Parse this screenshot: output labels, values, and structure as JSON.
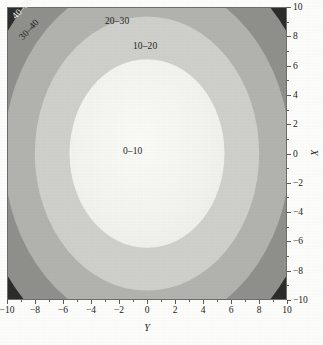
{
  "chart_data": {
    "type": "contour",
    "title": "",
    "xlabel": "Y",
    "ylabel": "X",
    "xlim": [
      -10,
      10
    ],
    "ylim": [
      -10,
      10
    ],
    "xticks": [
      "-10",
      "-8",
      "-6",
      "-4",
      "-2",
      "0",
      "2",
      "4",
      "6",
      "8",
      "10"
    ],
    "xtick_values": [
      -10,
      -8,
      -6,
      -4,
      -2,
      0,
      2,
      4,
      6,
      8,
      10
    ],
    "yticks": [
      "10",
      "8",
      "6",
      "4",
      "2",
      "0",
      "-2",
      "-4",
      "-6",
      "-8",
      "-10"
    ],
    "ytick_values": [
      10,
      8,
      6,
      4,
      2,
      0,
      -2,
      -4,
      -6,
      -8,
      -10
    ],
    "yaxis_side": "right",
    "grid": false,
    "legend": "inline-band-labels",
    "contour_levels": [
      0,
      10,
      20,
      30,
      40,
      50
    ],
    "bands": [
      {
        "label": "0-10",
        "range": [
          0,
          10
        ],
        "color": "#f4f4f0",
        "rx_data": 5.6,
        "ry_data": 6.5
      },
      {
        "label": "10-20",
        "range": [
          10,
          20
        ],
        "color": "#cfcfcb",
        "rx_data": 8.1,
        "ry_data": 9.4
      },
      {
        "label": "20-30",
        "range": [
          20,
          30
        ],
        "color": "#b2b2ae",
        "rx_data": 10.3,
        "ry_data": 12.0
      },
      {
        "label": "30-40",
        "range": [
          30,
          40
        ],
        "color": "#8f8f8b",
        "rx_data": 12.4,
        "ry_data": 14.4
      },
      {
        "label": "40-50",
        "range": [
          40,
          50
        ],
        "color": "#2b2b29",
        "rx_data": 99.0,
        "ry_data": 99.0
      }
    ],
    "center": [
      0,
      0
    ]
  },
  "axes": {
    "x": {
      "title": "Y",
      "ticks": [
        {
          "value": -10,
          "label": "-10"
        },
        {
          "value": -8,
          "label": "-8"
        },
        {
          "value": -6,
          "label": "-6"
        },
        {
          "value": -4,
          "label": "-4"
        },
        {
          "value": -2,
          "label": "-2"
        },
        {
          "value": 0,
          "label": "0"
        },
        {
          "value": 2,
          "label": "2"
        },
        {
          "value": 4,
          "label": "4"
        },
        {
          "value": 6,
          "label": "6"
        },
        {
          "value": 8,
          "label": "8"
        },
        {
          "value": 10,
          "label": "10"
        }
      ]
    },
    "y": {
      "title": "X",
      "ticks": [
        {
          "value": 10,
          "label": "10"
        },
        {
          "value": 8,
          "label": "8"
        },
        {
          "value": 6,
          "label": "6"
        },
        {
          "value": 4,
          "label": "4"
        },
        {
          "value": 2,
          "label": "2"
        },
        {
          "value": 0,
          "label": "0"
        },
        {
          "value": -2,
          "label": "-2"
        },
        {
          "value": -4,
          "label": "-4"
        },
        {
          "value": -6,
          "label": "-6"
        },
        {
          "value": -8,
          "label": "-8"
        },
        {
          "value": -10,
          "label": "-10"
        }
      ]
    }
  },
  "band_labels": {
    "inner": "0–10",
    "second": "10–20",
    "third": "20–30",
    "fourth": "30–40",
    "outer": "40–50"
  },
  "colors": {
    "band_0_10": "#f4f4f0",
    "band_10_20": "#cfcfcb",
    "band_20_30": "#b2b2ae",
    "band_30_40": "#8f8f8b",
    "band_40_50": "#2b2b29",
    "background": "#fdfdfb",
    "axis": "#5c5c57",
    "text": "#222220"
  }
}
